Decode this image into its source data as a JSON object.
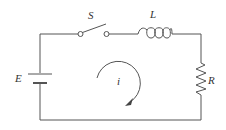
{
  "diagram": {
    "type": "RL series circuit",
    "labels": {
      "switch": "S",
      "inductor": "L",
      "source": "E",
      "resistor": "R",
      "current": "i"
    },
    "components": [
      {
        "id": "source",
        "kind": "battery",
        "label": "E",
        "position": "left branch"
      },
      {
        "id": "switch",
        "kind": "switch (open)",
        "label": "S",
        "position": "top branch"
      },
      {
        "id": "inductor",
        "kind": "inductor",
        "label": "L",
        "position": "top branch"
      },
      {
        "id": "resistor",
        "kind": "resistor",
        "label": "R",
        "position": "right branch"
      }
    ],
    "current_direction": "clockwise"
  },
  "colors": {
    "line": "#555555",
    "text": "#333333",
    "background": "#ffffff"
  }
}
